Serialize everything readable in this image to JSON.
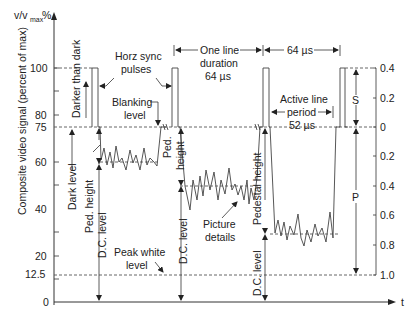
{
  "figure": {
    "y_axis_top_label": "v/v max %",
    "y_axis_label": "Composite video signal (percent of max)",
    "x_axis_label": "t",
    "left_ticks": [
      "100",
      "80",
      "75",
      "60",
      "40",
      "20",
      "12.5",
      "0"
    ],
    "right_ticks": [
      "0.4",
      "0.2",
      "0",
      "0.2",
      "0.4",
      "0.6",
      "0.8",
      "1.0"
    ]
  },
  "annotations": {
    "darker_than_dark": "Darker than dark",
    "horz_sync_1": "Horz sync",
    "horz_sync_2": "pulses",
    "blanking_1": "Blanking",
    "blanking_2": "level",
    "one_line_1": "One line",
    "one_line_2": "duration",
    "one_line_3": "64 µs",
    "sixty_four": "64 µs",
    "active_1": "Active line",
    "active_2": "period",
    "active_3": "52 µs",
    "dark_level": "Dark level",
    "ped_height": "Ped. height",
    "ped_1": "Ped.",
    "ped_2": "height",
    "pedestal_height": "Pedestal height",
    "dc_level": "D.C. level",
    "picture_1": "Picture",
    "picture_2": "details",
    "peak_white_1": "Peak white",
    "peak_white_2": "level",
    "s_label": "S",
    "p_label": "P"
  }
}
